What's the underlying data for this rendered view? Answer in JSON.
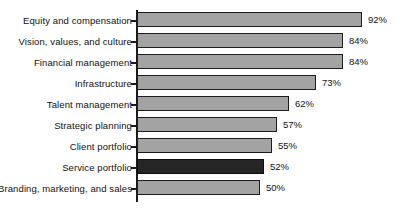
{
  "chart": {
    "type": "bar",
    "orientation": "horizontal",
    "title": "",
    "xlabel": "",
    "ylabel": "",
    "grid": false,
    "legend": "none",
    "value_suffix": "%"
  },
  "chart_data": {
    "type": "bar",
    "orientation": "horizontal",
    "title": "",
    "subtitle": "",
    "xlabel": "",
    "ylabel": "",
    "xlim": [
      0,
      100
    ],
    "grid": false,
    "legend": "none",
    "categories": [
      "Equity and compensation",
      "Vision, values, and culture",
      "Financial management",
      "Infrastructure",
      "Talent management",
      "Strategic planning",
      "Client portfolio",
      "Service portfolio",
      "Branding, marketing, and sales"
    ],
    "values": [
      92,
      84,
      84,
      73,
      62,
      57,
      55,
      52,
      50
    ],
    "value_labels": [
      "92%",
      "84%",
      "84%",
      "73%",
      "62%",
      "57%",
      "55%",
      "52%",
      "50%"
    ],
    "highlighted_category": "Service portfolio",
    "colors": {
      "bar_fill": "#a3a3a3",
      "bar_highlight_fill": "#262626",
      "bar_border": "#1c1c1c",
      "axis": "#1a1a1a",
      "text": "#111111",
      "background": "#ffffff"
    },
    "bars": [
      {
        "category": "Equity and compensation",
        "value": 92,
        "label": "92%",
        "highlighted": false
      },
      {
        "category": "Vision, values, and culture",
        "value": 84,
        "label": "84%",
        "highlighted": false
      },
      {
        "category": "Financial management",
        "value": 84,
        "label": "84%",
        "highlighted": false
      },
      {
        "category": "Infrastructure",
        "value": 73,
        "label": "73%",
        "highlighted": false
      },
      {
        "category": "Talent management",
        "value": 62,
        "label": "62%",
        "highlighted": false
      },
      {
        "category": "Strategic planning",
        "value": 57,
        "label": "57%",
        "highlighted": false
      },
      {
        "category": "Client portfolio",
        "value": 55,
        "label": "55%",
        "highlighted": false
      },
      {
        "category": "Service portfolio",
        "value": 52,
        "label": "52%",
        "highlighted": true
      },
      {
        "category": "Branding, marketing, and sales",
        "value": 50,
        "label": "50%",
        "highlighted": false
      }
    ]
  }
}
